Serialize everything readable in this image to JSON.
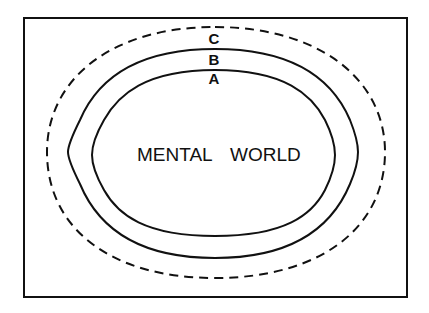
{
  "diagram": {
    "title_left": "MENTAL",
    "title_right": "WORLD",
    "boundaries": [
      {
        "label": "A",
        "style": "solid",
        "description": "inner boundary"
      },
      {
        "label": "B",
        "style": "solid",
        "description": "middle boundary"
      },
      {
        "label": "C",
        "style": "dashed",
        "description": "outer boundary"
      }
    ],
    "colors": {
      "stroke": "#111111",
      "background": "#ffffff"
    }
  }
}
